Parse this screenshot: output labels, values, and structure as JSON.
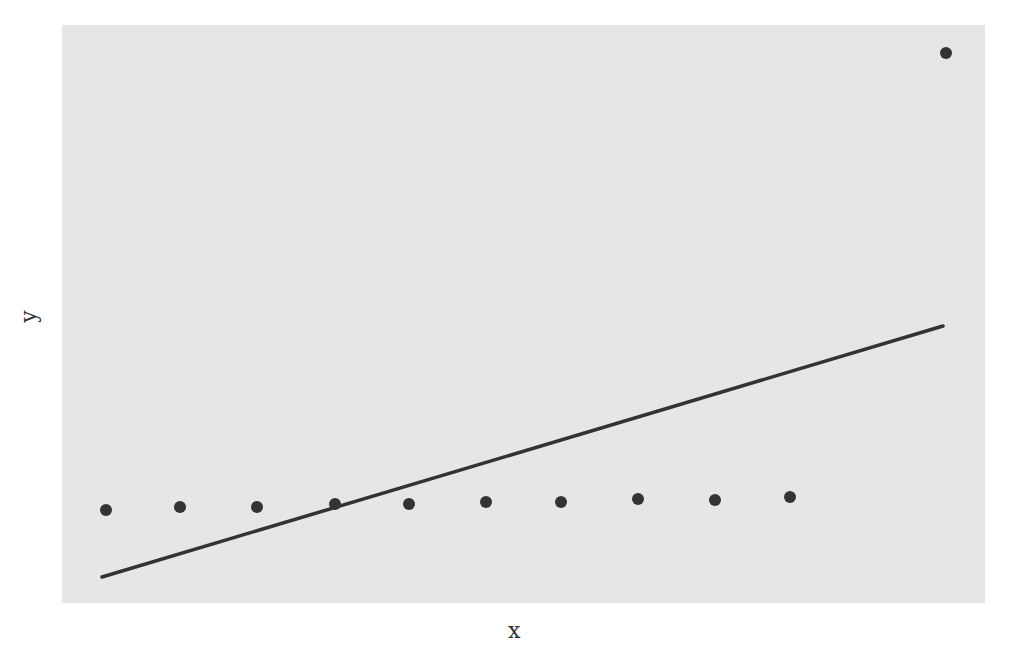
{
  "chart_data": {
    "type": "scatter",
    "title": "",
    "xlabel": "x",
    "ylabel": "y",
    "grid": false,
    "legend": null,
    "x_ticks": [],
    "y_ticks": [],
    "series": [
      {
        "name": "points",
        "kind": "scatter",
        "color": "#333333",
        "points": [
          {
            "x": 1,
            "y": 0.3
          },
          {
            "x": 2,
            "y": 0.31
          },
          {
            "x": 3,
            "y": 0.31
          },
          {
            "x": 4,
            "y": 0.32
          },
          {
            "x": 5,
            "y": 0.32
          },
          {
            "x": 6,
            "y": 0.33
          },
          {
            "x": 7,
            "y": 0.33
          },
          {
            "x": 8,
            "y": 0.34
          },
          {
            "x": 9,
            "y": 0.34
          },
          {
            "x": 10,
            "y": 0.35
          },
          {
            "x": 12,
            "y": 3.0
          }
        ]
      },
      {
        "name": "fit",
        "kind": "line",
        "color": "#333333",
        "points": [
          {
            "x": 1,
            "y": 0.0
          },
          {
            "x": 12,
            "y": 1.4
          }
        ]
      }
    ],
    "pixel_layout": {
      "panel": {
        "left": 62,
        "top": 25,
        "width": 923,
        "height": 578,
        "color": "#e6e6e6"
      },
      "scatter_px": [
        [
          106,
          510
        ],
        [
          180,
          507
        ],
        [
          257,
          507
        ],
        [
          335,
          504
        ],
        [
          409,
          504
        ],
        [
          486,
          502
        ],
        [
          561,
          502
        ],
        [
          638,
          499
        ],
        [
          715,
          500
        ],
        [
          790,
          497
        ],
        [
          946,
          53
        ]
      ],
      "line_px": [
        [
          102,
          577
        ],
        [
          943,
          326
        ]
      ]
    }
  },
  "axes": {
    "x_label": "x",
    "y_label": "y"
  }
}
